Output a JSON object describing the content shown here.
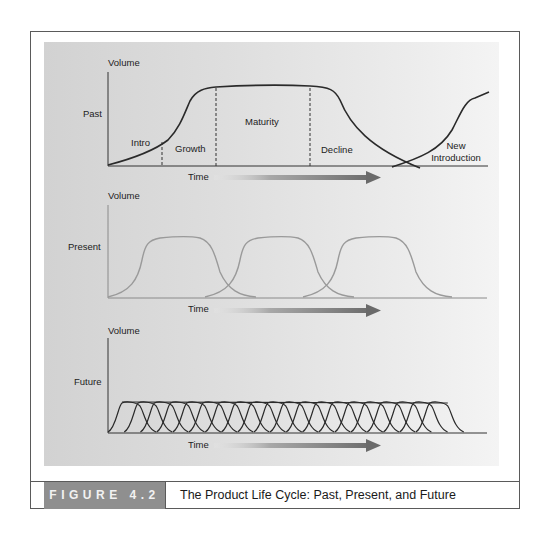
{
  "figure": {
    "label": "FIGURE 4.2",
    "title": "The Product Life Cycle: Past, Present, and Future"
  },
  "panels": [
    {
      "row_label": "Past",
      "y_axis": "Volume",
      "x_axis": "Time",
      "stages": [
        "Intro",
        "Growth",
        "Maturity",
        "Decline",
        "New Introduction"
      ],
      "stage_line_1": "New",
      "stage_line_2": "Introduction",
      "curve_color": "#2a2a2a"
    },
    {
      "row_label": "Present",
      "y_axis": "Volume",
      "x_axis": "Time",
      "cycles": 3,
      "curve_color": "#9a9a9a"
    },
    {
      "row_label": "Future",
      "y_axis": "Volume",
      "x_axis": "Time",
      "cycles": 20,
      "curve_color": "#2a2a2a"
    }
  ],
  "colors": {
    "panel_bg": "#d8d8d8",
    "figure_label_bg": "#8f8f8f",
    "arrow": "#6e6e6e"
  }
}
